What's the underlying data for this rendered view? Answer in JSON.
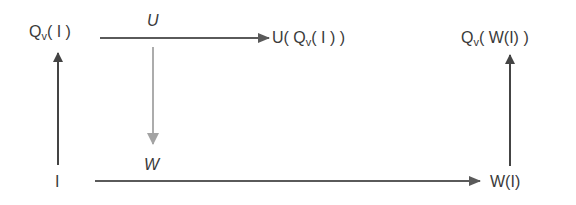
{
  "diagram": {
    "type": "commutative-diagram",
    "nodes": {
      "q_i": {
        "main": "Q",
        "sub": "v",
        "rest": "( I )"
      },
      "u_q_i": {
        "prefix": "U( ",
        "main": "Q",
        "sub": "v",
        "rest": "( I ) )"
      },
      "q_w_i": {
        "main": "Q",
        "sub": "v",
        "rest": "( W(I) )"
      },
      "i": {
        "text": "I"
      },
      "w_i": {
        "text": "W(I)"
      }
    },
    "edge_labels": {
      "u": "U",
      "w": "W"
    },
    "edges": [
      {
        "from": "Q_v(I)",
        "to": "U(Q_v(I))",
        "label": "U",
        "color": "#555555"
      },
      {
        "from": "U-edge",
        "to": "W-label",
        "label": "",
        "color": "#a0a0a0"
      },
      {
        "from": "I",
        "to": "Q_v(I)",
        "label": "",
        "color": "#444444"
      },
      {
        "from": "I",
        "to": "W(I)",
        "label": "W",
        "color": "#555555"
      },
      {
        "from": "W(I)",
        "to": "Q_v(W(I))",
        "label": "",
        "color": "#444444"
      }
    ],
    "colors": {
      "dark_arrow": "#444444",
      "mid_arrow": "#5a5a5a",
      "light_arrow": "#a3a3a3",
      "text": "#3a3a3a"
    }
  }
}
